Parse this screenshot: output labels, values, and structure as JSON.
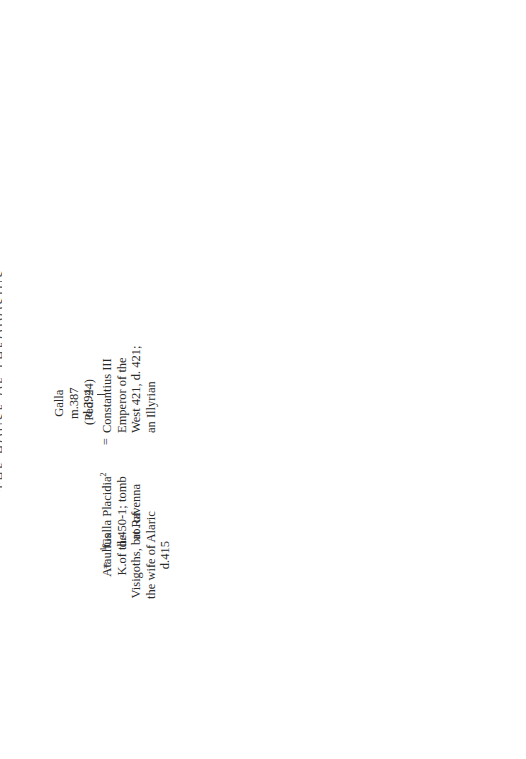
{
  "page": {
    "title_cut": "THE HOUSE OF THEODOSIUS",
    "footnote_italic": "See",
    "footnote_rest": " note p.256"
  },
  "refs": {
    "ped24_a": "(Ped. 24)",
    "ped24_b": "(Ped. 24)",
    "ped32": "(Ped. 32)",
    "ped27": "(Ped. 27)",
    "ped28": "(Ped. 28)",
    "ped26_a": "(Ped. 26)",
    "ped26_b": "(Ped. 26)",
    "ellipsis": ". . ."
  },
  "people": {
    "ataulfus": [
      "Ataulfus",
      "K.of the",
      "Visigoths, bro. of",
      "the wife of Alaric",
      "d.415"
    ],
    "galla_placidia": {
      "pre": "1",
      "name": "Galla Placidia",
      "post": "2",
      "lines": [
        "d.450-1; tomb",
        "at Ravenna"
      ]
    },
    "constantius": [
      "Constantius III",
      "Emperor of the",
      "West 421, d. 421;",
      "an Illyrian"
    ],
    "galla": [
      "Galla",
      "m.387",
      "d.394"
    ],
    "theodosius_i": {
      "pre": "2",
      "name": "Theodosius I",
      "post": "1",
      "lines": [
        "Emperor 379-395",
        "b.c.346"
      ]
    },
    "aelia_flavia": [
      "Aelia Flavia",
      "Flaccilla m.379",
      "d.386"
    ],
    "honorius_top": [
      "Honorius"
    ],
    "serena": [
      "Serena",
      "b.c.379",
      "m.c.384"
    ],
    "stilicho": [
      "Stilicho",
      "son of a Vandal",
      "father and a Roman",
      "mother; consul 400,",
      "405 d.408"
    ],
    "arcadius": [
      "Arcadius",
      "Emperor",
      "383-408, of",
      "the East from",
      "395 b.c.377"
    ],
    "eudoxia_bauto": [
      "Eudoxia",
      "dau.of",
      "Bauto,",
      "a Frank"
    ],
    "maria": [
      "Maria",
      "m.c.398"
    ],
    "honorius": {
      "pre": "1",
      "name": "Honorius",
      "post": "2",
      "lines": [
        "Emperor 393-",
        "423, of the",
        "West from",
        "395"
      ]
    },
    "thermantia": [
      "Thermantia",
      "m.408 d.415"
    ],
    "theodosius_young": [
      "Theodosius",
      "d. young"
    ],
    "eudocia": [
      "Eudocia (Athenais)",
      "dau.of Leontius,",
      "professor of rhetoric",
      "at Athens d.454"
    ],
    "theodosius_ii": [
      "Theodosius II",
      "Augustus 402,",
      "Emperor of the",
      "East 408-450",
      "b.401"
    ],
    "pulcheria": [
      "Pulcheria",
      "Empress of",
      "the East",
      "414-454",
      "b.390 m.451"
    ],
    "marcian": {
      "pre": "2",
      "name": "Marcian",
      "post": "1",
      "lines": [
        "Emperor of",
        "the East",
        "450-457"
      ]
    },
    "euphemia": [
      "Euphemia"
    ],
    "anthemius": [
      "Anthemius",
      "Emperor of the",
      "West 467-472"
    ],
    "julia_grata": [
      "Julia Grata",
      "Honoria offered",
      "herself in marriage",
      "to Attila the Hun"
    ],
    "valentinian": [
      "Valentinian III",
      "Emperor of the",
      "West 425-455",
      "b.419"
    ],
    "eudoxia_422": [
      "Eudoxia",
      "b.422"
    ],
    "huneric": [
      "Huneric",
      "K.of the",
      "Vandals",
      "484"
    ],
    "eudoxia_young": [
      "Eudoxia"
    ],
    "placidia": [
      "Placidia"
    ],
    "olybrius": [
      "Anicius Olybrius",
      "consul 464, Emperor of",
      "the West 472 (Ped. 22)"
    ],
    "anicia_juliana": [
      "Anicia Juliana"
    ],
    "areobindus": [
      "Flavius Areobindus",
      "consul 506"
    ]
  },
  "symbols": {
    "marriage": "=",
    "arrow_down": "↓"
  }
}
